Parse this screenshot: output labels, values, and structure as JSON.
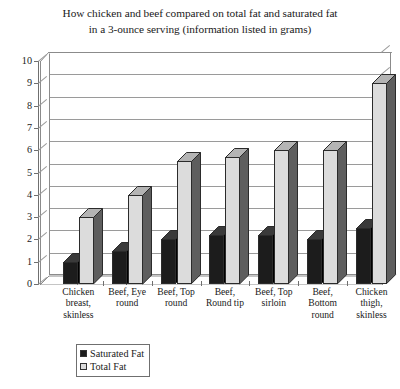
{
  "chart_data": {
    "type": "bar",
    "title": "How chicken and beef compared on total fat and saturated fat in a 3-ounce serving (information listed in grams)",
    "title_lines": [
      "How chicken and beef compared on total fat and saturated fat",
      "in a 3-ounce serving (information listed in grams)"
    ],
    "xlabel": "",
    "ylabel": "",
    "ylim": [
      0,
      10
    ],
    "ytick_step": 1,
    "grid": true,
    "legend_position": "bottom-center",
    "style": "3d-clustered-column",
    "categories": [
      "Chicken breast, skinless",
      "Beef, Eye round",
      "Beef, Top round",
      "Beef, Round tip",
      "Beef, Top sirloin",
      "Beef, Bottom round",
      "Chicken thigh, skinless"
    ],
    "category_lines": [
      [
        "Chicken",
        "breast,",
        "skinless"
      ],
      [
        "Beef, Eye",
        "round"
      ],
      [
        "Beef, Top",
        "round"
      ],
      [
        "Beef,",
        "Round tip"
      ],
      [
        "Beef, Top",
        "sirloin"
      ],
      [
        "Beef,",
        "Bottom",
        "round"
      ],
      [
        "Chicken",
        "thigh,",
        "skinless"
      ]
    ],
    "ytick_labels": [
      "10",
      "9",
      "8",
      "7",
      "6",
      "5",
      "4",
      "3",
      "2",
      "1",
      "0"
    ],
    "series": [
      {
        "name": "Saturated Fat",
        "color": "#1c1c1c",
        "side_color": "#000000",
        "top_color": "#3a3a3a",
        "values": [
          1.0,
          1.5,
          2.0,
          2.2,
          2.2,
          2.0,
          2.5
        ]
      },
      {
        "name": "Total Fat",
        "color": "#dcdcdc",
        "side_color": "#5e5e5e",
        "top_color": "#b4b4b4",
        "values": [
          3.0,
          4.0,
          5.5,
          5.7,
          6.0,
          6.0,
          9.0
        ]
      }
    ]
  },
  "legend": {
    "entries": [
      {
        "label": "Saturated Fat"
      },
      {
        "label": "Total Fat"
      }
    ]
  },
  "colors": {
    "axis": "#6f6f6f",
    "grid": "#9a9a9a",
    "frame": "#8b8b8b",
    "background": "#ffffff",
    "saturated_fat": "#1c1c1c",
    "total_fat": "#dcdcdc"
  }
}
